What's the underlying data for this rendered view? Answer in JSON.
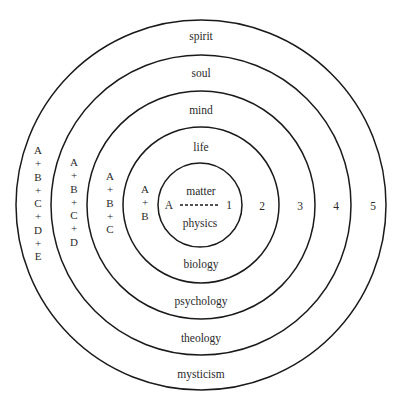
{
  "diagram": {
    "type": "concentric-circles",
    "center": {
      "x": 200,
      "y": 205
    },
    "rings": [
      {
        "level": 1,
        "radius": 42,
        "top_label": "matter",
        "bottom_label": "physics",
        "number": "1",
        "stack": [
          "A"
        ]
      },
      {
        "level": 2,
        "radius": 78,
        "top_label": "life",
        "bottom_label": "biology",
        "number": "2",
        "stack": [
          "A",
          "+",
          "B"
        ]
      },
      {
        "level": 3,
        "radius": 114,
        "top_label": "mind",
        "bottom_label": "psychology",
        "number": "3",
        "stack": [
          "A",
          "+",
          "B",
          "+",
          "C"
        ]
      },
      {
        "level": 4,
        "radius": 150,
        "top_label": "soul",
        "bottom_label": "theology",
        "number": "4",
        "stack": [
          "A",
          "+",
          "B",
          "+",
          "C",
          "+",
          "D"
        ]
      },
      {
        "level": 5,
        "radius": 186,
        "top_label": "spirit",
        "bottom_label": "mysticism",
        "number": "5",
        "stack": [
          "A",
          "+",
          "B",
          "+",
          "C",
          "+",
          "D",
          "+",
          "E"
        ]
      }
    ],
    "inner_axis": {
      "start_label": "A",
      "end_label": "1",
      "line_style": "dashed"
    },
    "line_color": "#1a1a1a"
  }
}
